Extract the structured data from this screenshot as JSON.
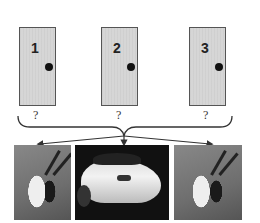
{
  "diagram": {
    "doors": [
      {
        "label": "1",
        "hidden_prize": "?"
      },
      {
        "label": "2",
        "hidden_prize": "?"
      },
      {
        "label": "3",
        "hidden_prize": "?"
      }
    ],
    "outcomes": [
      {
        "name": "goat"
      },
      {
        "name": "car"
      },
      {
        "name": "goat"
      }
    ],
    "colors": {
      "door_fill": "#d6d6d6",
      "door_border": "#555555",
      "knob": "#111111",
      "arrow": "#333333"
    }
  }
}
